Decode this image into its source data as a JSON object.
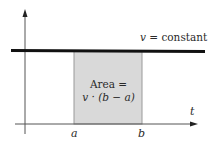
{
  "diagram": {
    "type": "velocity-time graph",
    "line_label": {
      "var": "v",
      "rest": " = constant"
    },
    "area_label": {
      "line1": "Area =",
      "line2": "v · (b − a)"
    },
    "x_axis_label": "t",
    "tick_labels": {
      "a": "a",
      "b": "b"
    },
    "colors": {
      "line": "#111111",
      "axis": "#555555",
      "shade": "#d9d9d9",
      "shade_edge": "#9a9a9a",
      "text": "#2a2a2a"
    }
  }
}
